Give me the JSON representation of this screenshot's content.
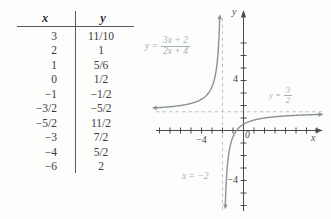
{
  "figure": {
    "table": {
      "col_x_header": "x",
      "col_y_header": "y",
      "rows": [
        {
          "x": "3",
          "y": "11/10"
        },
        {
          "x": "2",
          "y": "1"
        },
        {
          "x": "1",
          "y": "5/6"
        },
        {
          "x": "0",
          "y": "1/2"
        },
        {
          "x": "−1",
          "y": "−1/2"
        },
        {
          "x": "−3/2",
          "y": "−5/2"
        },
        {
          "x": "−5/2",
          "y": "11/2"
        },
        {
          "x": "−3",
          "y": "7/2"
        },
        {
          "x": "−4",
          "y": "5/2"
        },
        {
          "x": "−6",
          "y": "2"
        }
      ]
    },
    "graph": {
      "equation_label": {
        "prefix": "y =",
        "numerator": "3x + 2",
        "denominator": "2x + 4"
      },
      "h_asymptote_label": {
        "prefix": "y =",
        "numerator": "3",
        "denominator": "2"
      },
      "v_asymptote_label": "x = −2",
      "origin_label": "0",
      "x_axis_label": "x",
      "y_axis_label": "y",
      "x_tick_label_minus4": "−4",
      "y_tick_label_4": "4",
      "y_tick_label_minus4": "−4",
      "colors": {
        "curve": "#879297",
        "label": "#a3b2b8",
        "axis": "#4a4a4a",
        "dash": "#bfc3c4",
        "text": "#3b3b3b"
      }
    }
  },
  "chart_data": {
    "type": "line",
    "title": "",
    "function": "y = (3x + 2) / (2x + 4)",
    "numerator_coeffs": [
      3,
      2
    ],
    "denominator_coeffs": [
      2,
      4
    ],
    "vertical_asymptote_x": -2,
    "horizontal_asymptote_y": 1.5,
    "xlim": [
      -8,
      7
    ],
    "ylim": [
      -6,
      7
    ],
    "x_tick_step": 1,
    "y_tick_step": 1,
    "labeled_x_ticks": [
      -4
    ],
    "labeled_y_ticks": [
      4,
      -4
    ],
    "table_points": [
      {
        "x": 3,
        "y": 1.1
      },
      {
        "x": 2,
        "y": 1
      },
      {
        "x": 1,
        "y": 0.8333
      },
      {
        "x": 0,
        "y": 0.5
      },
      {
        "x": -1,
        "y": -0.5
      },
      {
        "x": -1.5,
        "y": -2.5
      },
      {
        "x": -2.5,
        "y": 5.5
      },
      {
        "x": -3,
        "y": 3.5
      },
      {
        "x": -4,
        "y": 2.5
      },
      {
        "x": -6,
        "y": 2
      }
    ]
  }
}
